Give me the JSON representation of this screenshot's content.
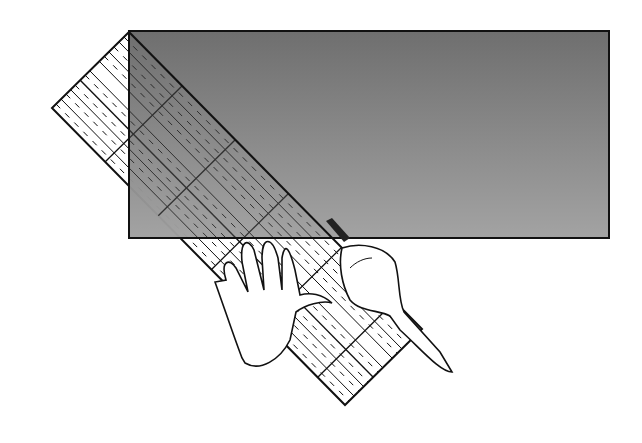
{
  "figure": {
    "colors": {
      "background": "#ffffff",
      "fabric_top": "#6e6e6e",
      "fabric_bottom": "#9a9a9a",
      "outline": "#111111",
      "ruler_fill": "#ffffff"
    },
    "elements": [
      "fabric-rectangle",
      "quilting-ruler",
      "left-hand",
      "right-hand",
      "rotary-cutter"
    ]
  }
}
